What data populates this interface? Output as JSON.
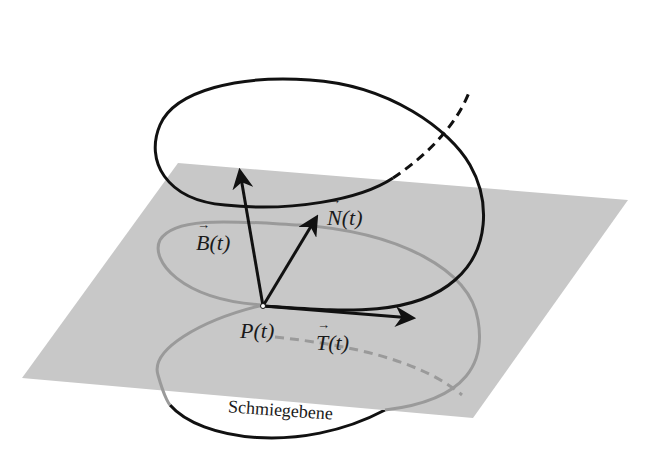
{
  "diagram": {
    "plane_label": "Schmiegebene",
    "point_label": "P(t)",
    "vectors": [
      {
        "name": "binormal",
        "symbol": "B",
        "arg": "(t)"
      },
      {
        "name": "normal",
        "symbol": "N",
        "arg": "(t)"
      },
      {
        "name": "tangent",
        "symbol": "T",
        "arg": "(t)"
      }
    ],
    "colors": {
      "plane": "#c8c8c8",
      "curve_front": "#111111",
      "curve_behind": "#9a9a9a",
      "background": "#ffffff"
    }
  }
}
